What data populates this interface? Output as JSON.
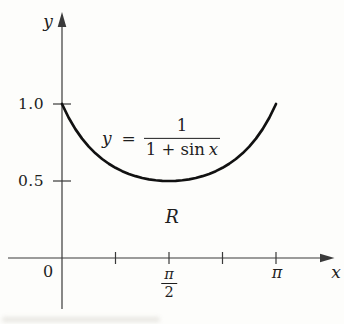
{
  "figure": {
    "background": "#fdfdfb",
    "text_color": "#1e1e1e",
    "axis_color": "#3a3a3a",
    "curve_color": "#111111"
  },
  "labels": {
    "y_axis": "y",
    "x_axis": "x",
    "origin": "0",
    "ytick_1_0": "1.0",
    "ytick_0_5": "0.5",
    "xtick_pi": "π",
    "xtick_pi2_num": "π",
    "xtick_pi2_den": "2",
    "region": "R"
  },
  "equation": {
    "lhs_var": "y",
    "equals": "=",
    "numerator": "1",
    "den_prefix": "1 +",
    "den_fn": "sin",
    "den_var": "x",
    "as_text": "y = 1/(1 + sin x)"
  },
  "chart_data": {
    "type": "line",
    "title": "",
    "equation": "y = 1/(1 + sin x)",
    "xlabel": "x",
    "ylabel": "y",
    "x_unit": "multiples of pi (radians)",
    "xlim_pi": [
      0,
      1
    ],
    "ylim": [
      0,
      1.15
    ],
    "grid": false,
    "legend": false,
    "region_label": "R",
    "x_pi": [
      0,
      0.03125,
      0.0625,
      0.09375,
      0.125,
      0.15625,
      0.1875,
      0.21875,
      0.25,
      0.28125,
      0.3125,
      0.34375,
      0.375,
      0.40625,
      0.4375,
      0.46875,
      0.5,
      0.53125,
      0.5625,
      0.59375,
      0.625,
      0.65625,
      0.6875,
      0.71875,
      0.75,
      0.78125,
      0.8125,
      0.84375,
      0.875,
      0.90625,
      0.9375,
      0.96875,
      1
    ],
    "y": [
      1.0,
      0.9107,
      0.8367,
      0.775,
      0.7232,
      0.6796,
      0.6428,
      0.6119,
      0.5858,
      0.564,
      0.546,
      0.5314,
      0.5198,
      0.511,
      0.5048,
      0.5012,
      0.5,
      0.5012,
      0.5048,
      0.511,
      0.5198,
      0.5314,
      0.546,
      0.564,
      0.5858,
      0.6119,
      0.6428,
      0.6796,
      0.7232,
      0.775,
      0.8367,
      0.9107,
      1.0
    ],
    "xticks": [
      {
        "pos_pi": 0.25,
        "label": ""
      },
      {
        "pos_pi": 0.5,
        "label": "π/2"
      },
      {
        "pos_pi": 0.75,
        "label": ""
      },
      {
        "pos_pi": 1.0,
        "label": "π"
      }
    ],
    "yticks": [
      {
        "pos": 0.5,
        "label": "0.5"
      },
      {
        "pos": 1.0,
        "label": "1.0"
      }
    ]
  }
}
